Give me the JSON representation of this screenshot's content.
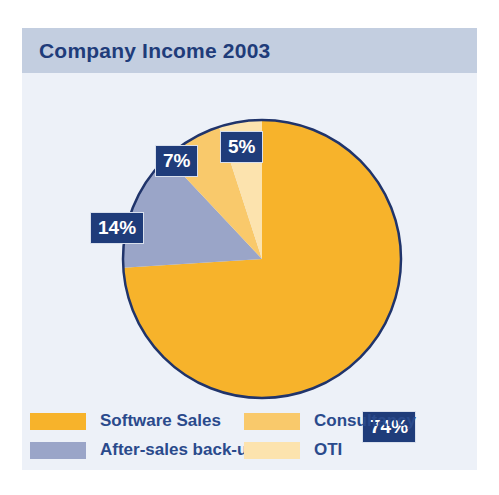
{
  "panel": {
    "background_color": "#edf1f8",
    "header_background_color": "#c3cee0",
    "title": "Company Income 2003",
    "title_color": "#1f3c7a"
  },
  "chart_data": {
    "type": "pie",
    "title": "Company Income 2003",
    "xlabel": "",
    "ylabel": "",
    "categories": [
      "Software Sales",
      "After-sales back-up",
      "Consultancy",
      "OTI"
    ],
    "values": [
      74,
      14,
      7,
      5
    ],
    "value_unit": "%",
    "colors": [
      "#f7b32b",
      "#9aa5c8",
      "#f9c96b",
      "#fce3ae"
    ],
    "legend_position": "bottom",
    "grid": false,
    "outline_color": "#20346b",
    "slices": [
      {
        "label": "Software Sales",
        "value": 74,
        "display": "74%",
        "color": "#f7b32b"
      },
      {
        "label": "After-sales back-up",
        "value": 14,
        "display": "14%",
        "color": "#9aa5c8"
      },
      {
        "label": "Consultancy",
        "value": 7,
        "display": "7%",
        "color": "#f9c96b"
      },
      {
        "label": "OTI",
        "value": 5,
        "display": "5%",
        "color": "#fce3ae"
      }
    ]
  },
  "callouts": {
    "software_sales": "74%",
    "after_sales": "14%",
    "consultancy": "7%",
    "oti": "5%",
    "box_color": "#1f3c7a",
    "text_color": "#ffffff"
  },
  "legend": {
    "label_color": "#2a4a8c",
    "items": [
      {
        "label": "Software Sales",
        "color": "#f7b32b"
      },
      {
        "label": "After-sales back-up",
        "color": "#9aa5c8"
      },
      {
        "label": "Consultancy",
        "color": "#f9c96b"
      },
      {
        "label": "OTI",
        "color": "#fce3ae"
      }
    ]
  }
}
